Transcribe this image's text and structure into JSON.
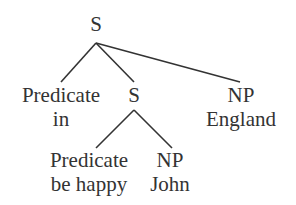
{
  "diagram": {
    "type": "syntax-tree",
    "colors": {
      "text": "#333333",
      "line": "#333333",
      "background": "#ffffff"
    },
    "nodes": {
      "root": {
        "label": "S"
      },
      "pred_in": {
        "label": "Predicate",
        "word": "in"
      },
      "s_inner": {
        "label": "S"
      },
      "np_england": {
        "label": "NP",
        "word": "England"
      },
      "pred_behappy": {
        "label": "Predicate",
        "word": "be happy"
      },
      "np_john": {
        "label": "NP",
        "word": "John"
      }
    },
    "edges": [
      {
        "from": "root",
        "to": "pred_in"
      },
      {
        "from": "root",
        "to": "s_inner"
      },
      {
        "from": "root",
        "to": "np_england"
      },
      {
        "from": "s_inner",
        "to": "pred_behappy"
      },
      {
        "from": "s_inner",
        "to": "np_john"
      }
    ]
  }
}
